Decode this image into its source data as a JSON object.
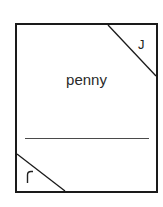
{
  "card": {
    "word": "penny",
    "top_right_mark": "J",
    "bottom_left_mark": "ſ"
  },
  "colors": {
    "border": "#1a1a1a",
    "text": "#2a2a2a",
    "rule": "#4a4a4a"
  }
}
